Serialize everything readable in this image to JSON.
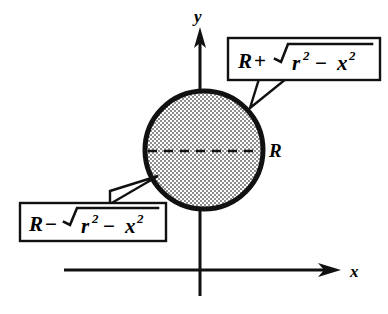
{
  "figure": {
    "background_color": "#ffffff",
    "ink_color": "#000000",
    "shade_color": "#9a9a9a"
  },
  "axes": {
    "x_label": "x",
    "y_label": "y",
    "x_axis_name": "horizontal-axis",
    "y_axis_name": "vertical-axis",
    "x_arrow_icon": "arrow-right-icon",
    "y_arrow_icon": "arrow-up-icon"
  },
  "circle": {
    "name": "shaded-circle",
    "fill_pattern": "checkerboard-stipple",
    "center_line_style": "dashed",
    "radius_label": "R"
  },
  "callouts": [
    {
      "id": "upper-callout",
      "position": "top-right",
      "lead": "R",
      "operator": "+",
      "radical_base": "r",
      "radical_base_sup": "2",
      "radical_op": "−",
      "radical_term": "x",
      "radical_term_sup": "2",
      "text_plain": "R + √(r² − x²)",
      "points_to": "circle-upper-right-edge"
    },
    {
      "id": "lower-callout",
      "position": "bottom-left",
      "lead": "R",
      "operator": "−",
      "radical_base": "r",
      "radical_base_sup": "2",
      "radical_op": "−",
      "radical_term": "x",
      "radical_term_sup": "2",
      "text_plain": "R − √(r² − x²)",
      "points_to": "circle-lower-left-edge"
    }
  ]
}
